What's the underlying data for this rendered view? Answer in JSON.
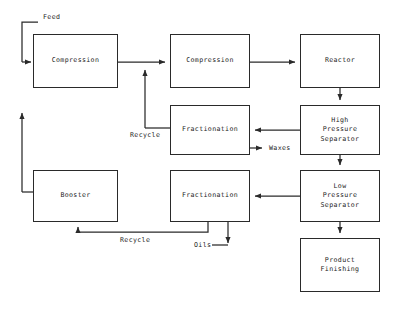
{
  "diagram": {
    "type": "process-flow-diagram",
    "background_color": "#ffffff",
    "line_color": "#2a2a2a",
    "text_color": "#1d1d1d",
    "units": [
      {
        "id": "compression-1",
        "label": "Compression",
        "x": 33,
        "y": 34,
        "w": 85,
        "h": 54
      },
      {
        "id": "compression-2",
        "label": "Compression",
        "x": 170,
        "y": 34,
        "w": 80,
        "h": 54
      },
      {
        "id": "reactor",
        "label": "Reactor",
        "x": 300,
        "y": 34,
        "w": 80,
        "h": 54
      },
      {
        "id": "fractionation-upper",
        "label": "Fractionation",
        "x": 170,
        "y": 105,
        "w": 80,
        "h": 50
      },
      {
        "id": "high-pressure-separator",
        "label": "High\nPressure\nSeparator",
        "x": 300,
        "y": 105,
        "w": 80,
        "h": 50
      },
      {
        "id": "booster",
        "label": "Booster",
        "x": 33,
        "y": 170,
        "w": 85,
        "h": 52
      },
      {
        "id": "fractionation-lower",
        "label": "Fractionation",
        "x": 170,
        "y": 170,
        "w": 80,
        "h": 52
      },
      {
        "id": "low-pressure-separator",
        "label": "Low\nPressure\nSeparator",
        "x": 300,
        "y": 170,
        "w": 80,
        "h": 52
      },
      {
        "id": "product-finishing",
        "label": "Product\nFinishing",
        "x": 300,
        "y": 238,
        "w": 80,
        "h": 54
      }
    ],
    "stream_labels": [
      {
        "id": "feed",
        "text": "Feed",
        "x": 43,
        "y": 13
      },
      {
        "id": "recycle-upper",
        "text": "Recycle",
        "x": 130,
        "y": 131
      },
      {
        "id": "waxes",
        "text": "Waxes",
        "x": 269,
        "y": 144
      },
      {
        "id": "recycle-lower",
        "text": "Recycle",
        "x": 120,
        "y": 236
      },
      {
        "id": "oils",
        "text": "Oils",
        "x": 194,
        "y": 241
      }
    ]
  }
}
